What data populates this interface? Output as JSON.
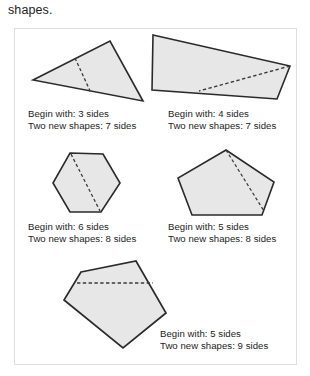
{
  "caption": {
    "top_text": "shapes."
  },
  "figure": {
    "border_color": "#dedede",
    "shape_fill": "#e7e7e7",
    "shape_stroke": "#2a2a2a",
    "dash_color": "#3a3a3a",
    "items": [
      {
        "id": "triangle-3-sides",
        "shape_name": "triangle",
        "begin_label": "Begin with: 3 sides",
        "result_label": "Two new shapes: 7 sides",
        "begin_sides": 3,
        "result_sides": 7,
        "points": "33,80 110,41 143,101",
        "dash": "75,58 91,93"
      },
      {
        "id": "quadrilateral-4-sides",
        "shape_name": "quadrilateral",
        "begin_label": "Begin with: 4 sides",
        "result_label": "Two new shapes: 7 sides",
        "begin_sides": 4,
        "result_sides": 7,
        "points": "153,35 290,66 277,99 152,90",
        "dash": "290,66 199,91"
      },
      {
        "id": "hexagon-6-sides",
        "shape_name": "hexagon",
        "begin_label": "Begin with: 6 sides",
        "result_label": "Two new shapes: 8 sides",
        "begin_sides": 6,
        "result_sides": 8,
        "points": "70,153 103,154 120,183 101,212 70,212 53,183",
        "dash": "71,154 100,211"
      },
      {
        "id": "pentagon-5-sides-a",
        "shape_name": "pentagon",
        "begin_label": "Begin with: 5 sides",
        "result_label": "Two new shapes: 8 sides",
        "begin_sides": 5,
        "result_sides": 8,
        "points": "226,150 274,182 262,215 192,215 178,178",
        "dash": "226,150 264,211"
      },
      {
        "id": "pentagon-5-sides-b",
        "shape_name": "pentagon",
        "begin_label": "Begin with: 5 sides",
        "result_label": "Two new shapes: 9 sides",
        "begin_sides": 5,
        "result_sides": 9,
        "points": "81,272 136,261 166,313 123,348 64,300",
        "dash": "77,283 153,283"
      }
    ]
  }
}
